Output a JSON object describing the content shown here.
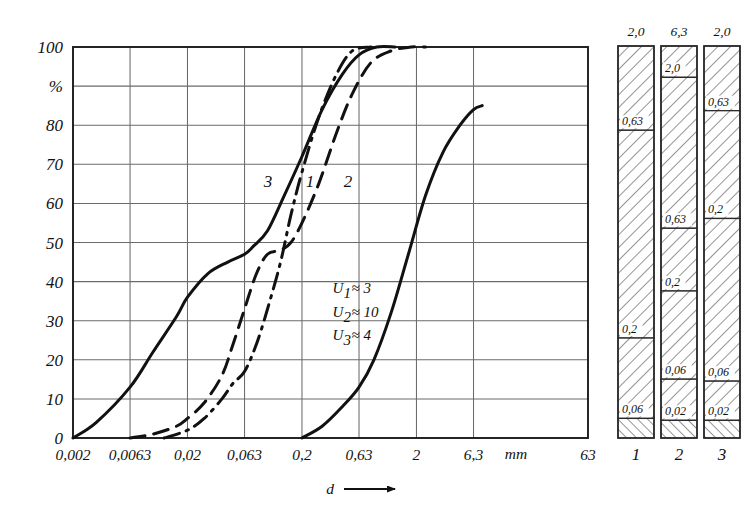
{
  "figure": {
    "kind": "grain-size-distribution",
    "background_color": "#ffffff",
    "ink_color": "#111111",
    "grid_color": "#6b6b6b"
  },
  "chart_data": {
    "type": "line",
    "title": "",
    "subtitle": "",
    "xlabel": "d",
    "xlabel_unit": "mm",
    "ylabel": "%",
    "x_scale": "log",
    "xlim": [
      0.002,
      63
    ],
    "ylim": [
      0,
      100
    ],
    "grid": true,
    "legend_position": "inline-curve-labels",
    "xtick_labels": [
      "0,002",
      "0,0063",
      "0,02",
      "0,063",
      "0,2",
      "0,63",
      "2",
      "6,3",
      "63"
    ],
    "xtick_values": [
      0.002,
      0.0063,
      0.02,
      0.063,
      0.2,
      0.63,
      2,
      6.3,
      63
    ],
    "xaxis_unit_label": "mm",
    "ytick_labels": [
      "0",
      "10",
      "20",
      "30",
      "40",
      "50",
      "60",
      "70",
      "80",
      "%",
      "100"
    ],
    "ytick_values": [
      0,
      10,
      20,
      30,
      40,
      50,
      60,
      70,
      80,
      90,
      100
    ],
    "series": [
      {
        "name": "1",
        "label": "1",
        "style": "solid",
        "points": [
          [
            0.002,
            0
          ],
          [
            0.0032,
            4
          ],
          [
            0.0063,
            13
          ],
          [
            0.01,
            22
          ],
          [
            0.016,
            31
          ],
          [
            0.02,
            36
          ],
          [
            0.03,
            42
          ],
          [
            0.045,
            45
          ],
          [
            0.063,
            47
          ],
          [
            0.075,
            49
          ],
          [
            0.1,
            53
          ],
          [
            0.14,
            62
          ],
          [
            0.2,
            72
          ],
          [
            0.3,
            84
          ],
          [
            0.45,
            93
          ],
          [
            0.63,
            98
          ],
          [
            0.9,
            100
          ],
          [
            1.3,
            100
          ]
        ]
      },
      {
        "name": "2",
        "label": "2",
        "style": "dashed",
        "points": [
          [
            0.0063,
            0
          ],
          [
            0.01,
            1
          ],
          [
            0.016,
            3
          ],
          [
            0.02,
            5
          ],
          [
            0.028,
            9
          ],
          [
            0.04,
            16
          ],
          [
            0.05,
            24
          ],
          [
            0.063,
            33
          ],
          [
            0.08,
            42
          ],
          [
            0.1,
            47
          ],
          [
            0.13,
            48
          ],
          [
            0.16,
            50
          ],
          [
            0.2,
            55
          ],
          [
            0.28,
            65
          ],
          [
            0.4,
            78
          ],
          [
            0.55,
            88
          ],
          [
            0.8,
            96
          ],
          [
            1.2,
            99
          ],
          [
            1.8,
            100
          ],
          [
            2.4,
            100
          ]
        ]
      },
      {
        "name": "3",
        "label": "3",
        "style": "dash-dot",
        "points": [
          [
            0.0125,
            0
          ],
          [
            0.02,
            2
          ],
          [
            0.028,
            5
          ],
          [
            0.04,
            10
          ],
          [
            0.05,
            14
          ],
          [
            0.063,
            17
          ],
          [
            0.08,
            24
          ],
          [
            0.1,
            33
          ],
          [
            0.13,
            45
          ],
          [
            0.16,
            57
          ],
          [
            0.2,
            68
          ],
          [
            0.28,
            82
          ],
          [
            0.4,
            93
          ],
          [
            0.55,
            99
          ],
          [
            0.8,
            100
          ]
        ]
      },
      {
        "name": "2-coarse",
        "label": "",
        "style": "solid",
        "points": [
          [
            0.2,
            0
          ],
          [
            0.3,
            3
          ],
          [
            0.45,
            8
          ],
          [
            0.63,
            13
          ],
          [
            0.85,
            20
          ],
          [
            1.2,
            32
          ],
          [
            1.7,
            47
          ],
          [
            2.4,
            62
          ],
          [
            3.4,
            73
          ],
          [
            4.8,
            80
          ],
          [
            6.3,
            84
          ],
          [
            7.5,
            85
          ]
        ]
      }
    ],
    "annotations": [
      {
        "text": "U1 ≈ 3",
        "sub": "1",
        "base": "U",
        "value": "≈ 3",
        "x": 0.37,
        "y": 37
      },
      {
        "text": "U2 ≈ 10",
        "sub": "2",
        "base": "U",
        "value": "≈ 10",
        "x": 0.37,
        "y": 31
      },
      {
        "text": "U3 ≈ 4",
        "sub": "3",
        "base": "U",
        "value": "≈ 4",
        "x": 0.37,
        "y": 25
      }
    ],
    "curve_label_positions": [
      {
        "label": "3",
        "x_px": 268,
        "y_px": 187
      },
      {
        "label": "1",
        "x_px": 310,
        "y_px": 187
      },
      {
        "label": "2",
        "x_px": 348,
        "y_px": 187
      }
    ]
  },
  "bar_diagrams": {
    "caption_row": [
      "1",
      "2",
      "3"
    ],
    "bars": [
      {
        "id": "1",
        "top_label": "2,0",
        "bottom_label": "1",
        "segments": [
          {
            "label": "0,63",
            "from_pct": 0.0,
            "to_pct": 21.5,
            "hatch": "right"
          },
          {
            "label": "0,2",
            "from_pct": 21.5,
            "to_pct": 74.5,
            "hatch": "right"
          },
          {
            "label": "0,06",
            "from_pct": 74.5,
            "to_pct": 95.0,
            "hatch": "right"
          },
          {
            "label": "",
            "from_pct": 95.0,
            "to_pct": 100.0,
            "hatch": "left"
          }
        ]
      },
      {
        "id": "2",
        "top_label": "6,3",
        "bottom_label": "2",
        "segments": [
          {
            "label": "2,0",
            "from_pct": 0.0,
            "to_pct": 8.0,
            "hatch": "right"
          },
          {
            "label": "0,63",
            "from_pct": 8.0,
            "to_pct": 46.5,
            "hatch": "right"
          },
          {
            "label": "0,2",
            "from_pct": 46.5,
            "to_pct": 62.5,
            "hatch": "right"
          },
          {
            "label": "0,06",
            "from_pct": 62.5,
            "to_pct": 85.0,
            "hatch": "right"
          },
          {
            "label": "0,02",
            "from_pct": 85.0,
            "to_pct": 95.5,
            "hatch": "right"
          },
          {
            "label": "",
            "from_pct": 95.5,
            "to_pct": 100.0,
            "hatch": "left"
          }
        ]
      },
      {
        "id": "3",
        "top_label": "2,0",
        "bottom_label": "3",
        "segments": [
          {
            "label": "0,63",
            "from_pct": 0.0,
            "to_pct": 16.5,
            "hatch": "right"
          },
          {
            "label": "0,2",
            "from_pct": 16.5,
            "to_pct": 44.0,
            "hatch": "right"
          },
          {
            "label": "0,06",
            "from_pct": 44.0,
            "to_pct": 85.5,
            "hatch": "right"
          },
          {
            "label": "0,02",
            "from_pct": 85.5,
            "to_pct": 95.5,
            "hatch": "right"
          },
          {
            "label": "",
            "from_pct": 95.5,
            "to_pct": 100.0,
            "hatch": "left"
          }
        ]
      }
    ]
  }
}
